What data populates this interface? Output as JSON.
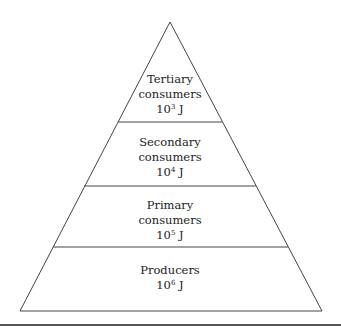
{
  "diagram": {
    "type": "energy-pyramid",
    "levels": [
      {
        "name_line1": "Tertiary",
        "name_line2": "consumers",
        "energy_base": "10",
        "energy_exp": "3",
        "energy_unit": "J"
      },
      {
        "name_line1": "Secondary",
        "name_line2": "consumers",
        "energy_base": "10",
        "energy_exp": "4",
        "energy_unit": "J"
      },
      {
        "name_line1": "Primary",
        "name_line2": "consumers",
        "energy_base": "10",
        "energy_exp": "5",
        "energy_unit": "J"
      },
      {
        "name_line1": "Producers",
        "energy_base": "10",
        "energy_exp": "6",
        "energy_unit": "J"
      }
    ]
  }
}
